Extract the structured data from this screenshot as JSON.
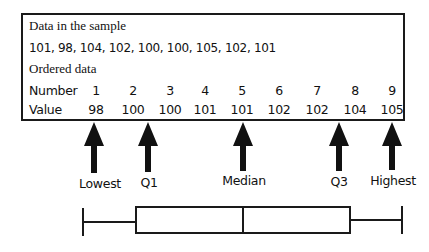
{
  "table": {
    "heading_sample": "Data in the sample",
    "sample_values": "101, 98, 104, 102, 100, 100, 105, 102, 101",
    "heading_ordered": "Ordered data",
    "row_number_label": "Number",
    "row_value_label": "Value",
    "numbers": [
      "1",
      "2",
      "3",
      "4",
      "5",
      "6",
      "7",
      "8",
      "9"
    ],
    "values": [
      "98",
      "100",
      "100",
      "101",
      "101",
      "102",
      "102",
      "104",
      "105"
    ]
  },
  "arrows": {
    "lowest": "Lowest",
    "q1": "Q1",
    "median": "Median",
    "q3": "Q3",
    "highest": "Highest"
  },
  "boxplot": {
    "min": 98,
    "q1": 100,
    "median": 101,
    "q3": 103,
    "max": 105
  }
}
